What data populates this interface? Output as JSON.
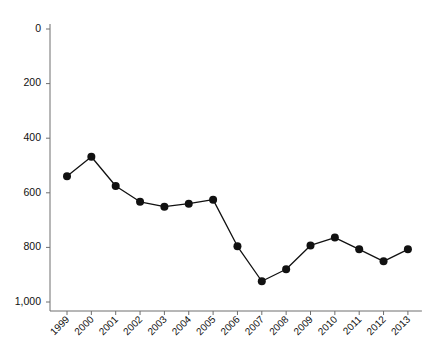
{
  "figure": {
    "background_color": "#ffffff",
    "axis_color": "#6e6e6e",
    "series_color": "#111111",
    "caption": ""
  },
  "chart_data": {
    "type": "line",
    "title": "",
    "subtitle": "",
    "xlabel": "",
    "ylabel": "",
    "grid": false,
    "legend_position": "none",
    "y_inverted": true,
    "ylim": [
      0,
      1000
    ],
    "yticks": [
      0,
      200,
      400,
      600,
      800,
      1000
    ],
    "ytick_labels": [
      "0",
      "200",
      "400",
      "600",
      "800",
      "1,000"
    ],
    "categories": [
      "1999",
      "2000",
      "2001",
      "2002",
      "2003",
      "2004",
      "2005",
      "2006",
      "2007",
      "2008",
      "2009",
      "2010",
      "2011",
      "2012",
      "2013"
    ],
    "values": [
      539,
      468,
      575,
      633,
      651,
      640,
      625,
      796,
      924,
      880,
      793,
      764,
      807,
      851,
      807
    ],
    "marker": "circle",
    "marker_size": 4,
    "line_width": 1.3
  }
}
